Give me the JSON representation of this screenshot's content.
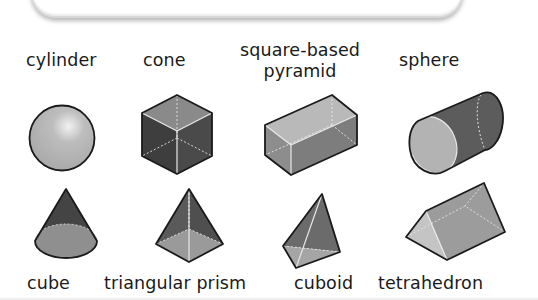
{
  "worksheet": {
    "instruction_frame": "",
    "top_labels": [
      {
        "text": "cylinder"
      },
      {
        "text": "cone"
      },
      {
        "text_line1": "square-based",
        "text_line2": "pyramid"
      },
      {
        "text": "sphere"
      }
    ],
    "bottom_labels": [
      {
        "text": "cube"
      },
      {
        "text": "triangular prism"
      },
      {
        "text": "cuboid"
      },
      {
        "text": "tetrahedron"
      }
    ],
    "shapes_row1": [
      "sphere",
      "cube",
      "cuboid",
      "cylinder"
    ],
    "shapes_row2": [
      "cone",
      "square-based-pyramid",
      "tetrahedron",
      "triangular-prism"
    ],
    "colors": {
      "outline": "#1a1a1a",
      "light_face": "#b8b8b8",
      "mid_face": "#8c8c8c",
      "dark_face": "#4a4a4a",
      "hidden_edge": "#e6e6e6"
    }
  }
}
